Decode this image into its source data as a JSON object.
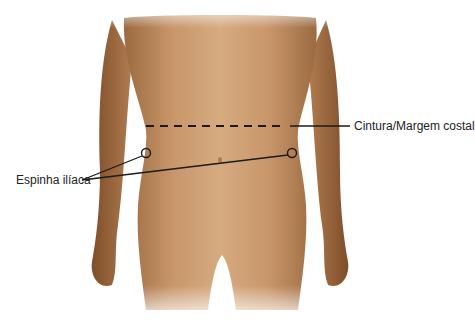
{
  "figure": {
    "colors": {
      "background": "#ffffff",
      "skin_light": "#d9ae84",
      "skin_mid": "#c08a5c",
      "skin_dark": "#8a5a34",
      "annotation": "#1a1a1a"
    }
  },
  "annotations": {
    "waist": {
      "label": "Cintura/Margem costal",
      "line_style": "dashed",
      "y": 126
    },
    "iliac": {
      "label": "Espinha ilíaca",
      "points": [
        {
          "name": "right-iliac-spine",
          "x": 146,
          "y": 153
        },
        {
          "name": "left-iliac-spine",
          "x": 292,
          "y": 153
        }
      ]
    }
  }
}
